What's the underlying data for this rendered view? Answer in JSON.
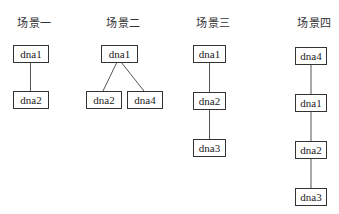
{
  "scenes": [
    {
      "title": "场景一",
      "nodes": [
        "dna1",
        "dna2"
      ],
      "edges": [
        [
          "dna1",
          "dna2"
        ]
      ]
    },
    {
      "title": "场景二",
      "nodes": [
        "dna1",
        "dna2",
        "dna4"
      ],
      "edges": [
        [
          "dna1",
          "dna2"
        ],
        [
          "dna1",
          "dna4"
        ]
      ]
    },
    {
      "title": "场景三",
      "nodes": [
        "dna1",
        "dna2",
        "dna3"
      ],
      "edges": [
        [
          "dna1",
          "dna2"
        ],
        [
          "dna2",
          "dna3"
        ]
      ]
    },
    {
      "title": "场景四",
      "nodes": [
        "dna4",
        "dna1",
        "dna2",
        "dna3"
      ],
      "edges": [
        [
          "dna4",
          "dna1"
        ],
        [
          "dna1",
          "dna2"
        ],
        [
          "dna2",
          "dna3"
        ]
      ]
    }
  ],
  "colors": {
    "line": "#555555",
    "border": "#333333",
    "text": "#222222"
  }
}
